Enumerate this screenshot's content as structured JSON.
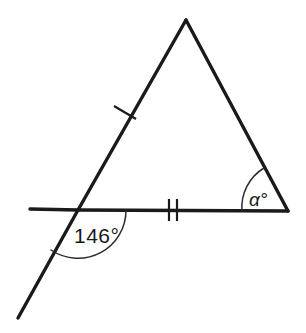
{
  "figure": {
    "background_color": "#ffffff",
    "stroke_color": "#1a1a1a",
    "arc_color": "#2b2b2b"
  },
  "labels": {
    "exterior_angle": {
      "value": "146",
      "degree_symbol": "°",
      "text": "146°"
    },
    "interior_angle": {
      "symbol": "α",
      "degree_symbol": "°",
      "text": "α°"
    }
  },
  "geometry": {
    "points": {
      "apex": {
        "x": 186,
        "y": 20
      },
      "bottom_left": {
        "x": 78,
        "y": 210
      },
      "bottom_right": {
        "x": 288,
        "y": 211
      },
      "baseline_left_end": {
        "x": 30,
        "y": 209
      },
      "transversal_lower_end": {
        "x": 18,
        "y": 318
      }
    },
    "tick_marks": {
      "left_side": {
        "count": 1,
        "x": 125,
        "y": 113
      },
      "base_side": {
        "count": 2,
        "x": 173,
        "y": 210
      }
    },
    "arcs": {
      "exterior_146": {
        "cx": 78,
        "cy": 210,
        "radius": 48
      },
      "interior_alpha": {
        "cx": 288,
        "cy": 211,
        "radius": 46
      }
    }
  }
}
